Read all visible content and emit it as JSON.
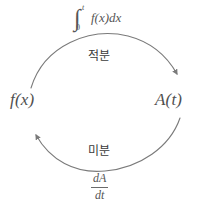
{
  "diagram": {
    "type": "cycle-diagram",
    "title": "",
    "stroke_color": "#7a7a7a",
    "text_color": "#4a4a4a",
    "background_color": "#ffffff",
    "nodes": [
      {
        "id": "fx",
        "label": "f(x)",
        "position": "left"
      },
      {
        "id": "at",
        "label": "A(t)",
        "position": "right"
      }
    ],
    "edges": [
      {
        "id": "integration",
        "from": "fx",
        "to": "at",
        "label": "적분",
        "direction": "left-to-right",
        "arc": "top",
        "formula": {
          "kind": "definite-integral",
          "integral_sign": "∫",
          "lower_limit": "0",
          "upper_limit": "t",
          "integrand": "f(x)dx"
        }
      },
      {
        "id": "differentiation",
        "from": "at",
        "to": "fx",
        "label": "미분",
        "direction": "right-to-left",
        "arc": "bottom",
        "formula": {
          "kind": "derivative-fraction",
          "numerator": "dA",
          "denominator": "dt"
        }
      }
    ]
  }
}
